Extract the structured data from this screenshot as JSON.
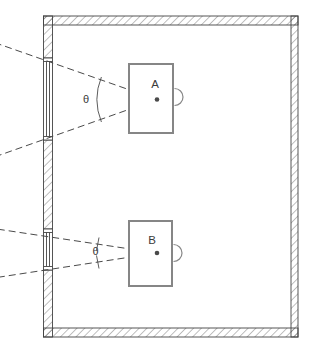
{
  "diagram": {
    "kind": "room-floor-plan",
    "labels": {
      "device_a": "A",
      "device_b": "B",
      "angle_a": "θ",
      "angle_b": "θ"
    },
    "colors": {
      "line": "#4a4a4a",
      "wall_outline": "#444444",
      "device_outline": "#868686",
      "background": "#ffffff"
    }
  }
}
